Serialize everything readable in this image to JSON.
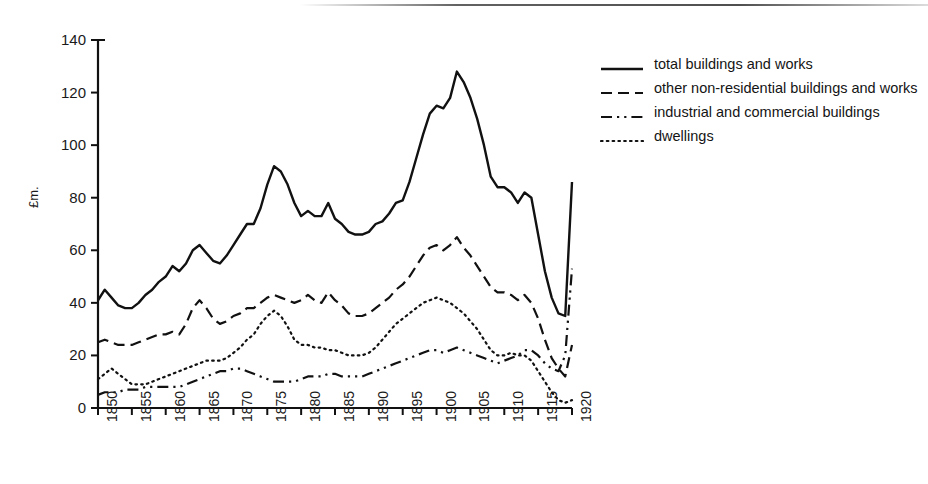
{
  "chart_data": {
    "type": "line",
    "title": "",
    "subtitle": "",
    "xlabel": "",
    "ylabel": "£m.",
    "xlim": [
      1850,
      1920
    ],
    "ylim": [
      0,
      140
    ],
    "yticks": [
      0,
      20,
      40,
      60,
      80,
      100,
      120,
      140
    ],
    "xticks": [
      1850,
      1855,
      1860,
      1865,
      1870,
      1875,
      1880,
      1885,
      1890,
      1895,
      1900,
      1905,
      1910,
      1915,
      1920
    ],
    "grid": false,
    "legend_position": "right",
    "x": [
      1850,
      1851,
      1852,
      1853,
      1854,
      1855,
      1856,
      1857,
      1858,
      1859,
      1860,
      1861,
      1862,
      1863,
      1864,
      1865,
      1866,
      1867,
      1868,
      1869,
      1870,
      1871,
      1872,
      1873,
      1874,
      1875,
      1876,
      1877,
      1878,
      1879,
      1880,
      1881,
      1882,
      1883,
      1884,
      1885,
      1886,
      1887,
      1888,
      1889,
      1890,
      1891,
      1892,
      1893,
      1894,
      1895,
      1896,
      1897,
      1898,
      1899,
      1900,
      1901,
      1902,
      1903,
      1904,
      1905,
      1906,
      1907,
      1908,
      1909,
      1910,
      1911,
      1912,
      1913,
      1914,
      1915,
      1916,
      1917,
      1918,
      1919,
      1920
    ],
    "series": [
      {
        "name": "total buildings and works",
        "style": "solid",
        "color": "#111111",
        "values": [
          41,
          45,
          42,
          39,
          38,
          38,
          40,
          43,
          45,
          48,
          50,
          54,
          52,
          55,
          60,
          62,
          59,
          56,
          55,
          58,
          62,
          66,
          70,
          70,
          76,
          85,
          92,
          90,
          85,
          78,
          73,
          75,
          73,
          73,
          78,
          72,
          70,
          67,
          66,
          66,
          67,
          70,
          71,
          74,
          78,
          79,
          86,
          95,
          104,
          112,
          115,
          114,
          118,
          128,
          124,
          118,
          110,
          100,
          88,
          84,
          84,
          82,
          78,
          82,
          80,
          66,
          52,
          42,
          36,
          35,
          86
        ]
      },
      {
        "name": "other non-residential buildings and works",
        "style": "dashed",
        "color": "#111111",
        "values": [
          25,
          26,
          25,
          24,
          24,
          24,
          25,
          26,
          27,
          28,
          28,
          29,
          28,
          32,
          38,
          41,
          38,
          34,
          32,
          33,
          35,
          36,
          38,
          38,
          40,
          42,
          43,
          42,
          41,
          40,
          41,
          43,
          41,
          40,
          44,
          41,
          39,
          36,
          35,
          35,
          36,
          38,
          40,
          42,
          45,
          47,
          50,
          54,
          58,
          61,
          62,
          60,
          62,
          65,
          61,
          58,
          54,
          50,
          46,
          44,
          44,
          43,
          41,
          43,
          40,
          34,
          26,
          19,
          15,
          12,
          24
        ]
      },
      {
        "name": "industrial and commercial buildings",
        "style": "dashdot",
        "color": "#111111",
        "values": [
          5,
          6,
          6,
          6,
          7,
          7,
          7,
          8,
          8,
          8,
          8,
          8,
          8,
          9,
          10,
          11,
          12,
          13,
          14,
          14,
          15,
          15,
          14,
          13,
          12,
          11,
          10,
          10,
          10,
          10,
          11,
          12,
          12,
          12,
          13,
          13,
          12,
          12,
          12,
          12,
          13,
          14,
          15,
          16,
          17,
          18,
          19,
          20,
          21,
          22,
          22,
          21,
          22,
          23,
          22,
          21,
          20,
          19,
          18,
          17,
          18,
          19,
          20,
          22,
          22,
          20,
          17,
          15,
          14,
          20,
          53
        ]
      },
      {
        "name": "dwellings",
        "style": "dotted",
        "color": "#111111",
        "values": [
          11,
          13,
          15,
          13,
          11,
          9,
          9,
          9,
          10,
          11,
          12,
          13,
          14,
          15,
          16,
          17,
          18,
          18,
          18,
          19,
          21,
          23,
          26,
          28,
          32,
          35,
          37,
          35,
          31,
          26,
          24,
          24,
          23,
          23,
          22,
          22,
          21,
          20,
          20,
          20,
          21,
          23,
          26,
          29,
          32,
          34,
          36,
          38,
          40,
          41,
          42,
          41,
          40,
          38,
          36,
          33,
          30,
          26,
          22,
          20,
          20,
          21,
          20,
          20,
          18,
          14,
          10,
          6,
          3,
          2,
          3
        ]
      }
    ]
  },
  "axis": {
    "ylabel": "£m.",
    "ytick_labels": [
      "140",
      "120",
      "100",
      "80",
      "60",
      "40",
      "20",
      "0"
    ],
    "xtick_labels": [
      "1850",
      "1855",
      "1860",
      "1865",
      "1870",
      "1875",
      "1880",
      "1885",
      "1890",
      "1895",
      "1900",
      "1905",
      "1910",
      "1915",
      "1920"
    ]
  },
  "legend": {
    "items": [
      {
        "label": "total buildings and works",
        "style": "solid"
      },
      {
        "label": "other non-residential buildings and works",
        "style": "dashed"
      },
      {
        "label": "industrial and commercial buildings",
        "style": "dashdot"
      },
      {
        "label": "dwellings",
        "style": "dotted"
      }
    ]
  }
}
